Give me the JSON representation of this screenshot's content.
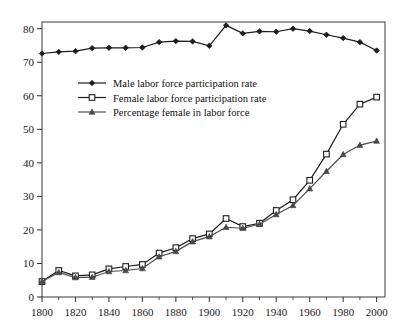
{
  "chart_data": {
    "type": "line",
    "title": "",
    "subtitle": "",
    "xlabel": "",
    "ylabel": "",
    "xlim": [
      1800,
      2005
    ],
    "ylim": [
      0,
      82
    ],
    "grid": false,
    "legend_position": "upper-left-inside",
    "x_tick_labels": [
      "1800",
      "1820",
      "1840",
      "1860",
      "1880",
      "1900",
      "1920",
      "1940",
      "1960",
      "1980",
      "2000"
    ],
    "x_tick_values": [
      1800,
      1820,
      1840,
      1860,
      1880,
      1900,
      1920,
      1940,
      1960,
      1980,
      2000
    ],
    "x_minor_tick_values": [
      1810,
      1830,
      1850,
      1870,
      1890,
      1910,
      1930,
      1950,
      1970,
      1990
    ],
    "y_tick_labels": [
      "0",
      "10",
      "20",
      "30",
      "40",
      "50",
      "60",
      "70",
      "80"
    ],
    "y_tick_values": [
      0,
      10,
      20,
      30,
      40,
      50,
      60,
      70,
      80
    ],
    "x": [
      1800,
      1810,
      1820,
      1830,
      1840,
      1850,
      1860,
      1870,
      1880,
      1890,
      1900,
      1910,
      1920,
      1930,
      1940,
      1950,
      1960,
      1970,
      1980,
      1990,
      2000
    ],
    "series": [
      {
        "name": "Male labor force participation rate",
        "marker": "filled-diamond",
        "values": [
          72.6,
          73.1,
          73.3,
          74.2,
          74.3,
          74.3,
          74.4,
          76.0,
          76.3,
          76.2,
          74.9,
          81.0,
          78.6,
          79.2,
          79.1,
          80.0,
          79.3,
          78.2,
          77.2,
          76.0,
          73.5
        ]
      },
      {
        "name": "Female labor force participation rate",
        "marker": "open-square",
        "values": [
          4.6,
          7.9,
          6.3,
          6.6,
          8.4,
          9.1,
          9.7,
          13.1,
          14.7,
          17.4,
          18.8,
          23.4,
          21.0,
          22.0,
          25.8,
          29.0,
          34.8,
          42.6,
          51.5,
          57.5,
          59.6
        ]
      },
      {
        "name": "Percentage female in labor force",
        "marker": "filled-triangle",
        "values": [
          4.6,
          7.3,
          5.8,
          5.9,
          7.6,
          7.9,
          8.5,
          12.0,
          13.6,
          16.5,
          18.0,
          20.8,
          20.5,
          21.7,
          24.6,
          27.3,
          32.3,
          37.5,
          42.5,
          45.3,
          46.5
        ]
      }
    ],
    "legend_entries": [
      "Male labor force participation rate",
      "Female labor force participation rate",
      "Percentage female in labor force"
    ],
    "colors": {
      "male_line": "#1d1d1d",
      "female_line": "#1d1d1d",
      "pct_female_line": "#4d4d4d",
      "axis": "#2b2b2b",
      "background": "#ffffff"
    }
  }
}
